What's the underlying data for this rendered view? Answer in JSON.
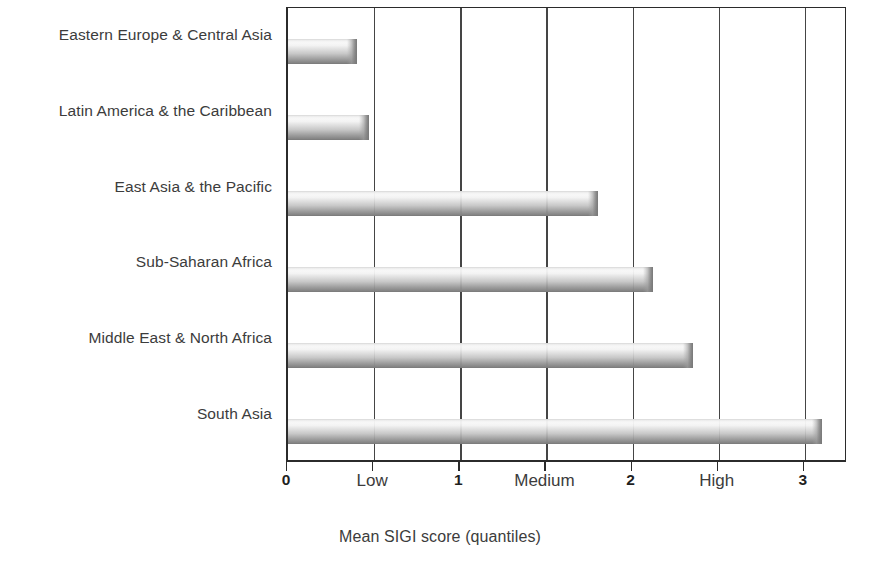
{
  "chart_data": {
    "type": "bar",
    "orientation": "horizontal",
    "title": "",
    "xlabel": "Mean SIGI score (quantiles)",
    "ylabel": "",
    "categories": [
      "Eastern Europe & Central Asia",
      "Latin America & the Caribbean",
      "East Asia & the Pacific",
      "Sub-Saharan Africa",
      "Middle East & North Africa",
      "South Asia"
    ],
    "values": [
      0.4,
      0.47,
      1.8,
      2.12,
      2.35,
      3.1
    ],
    "xlim": [
      0,
      3.25
    ],
    "ylim": [
      0,
      6
    ],
    "grid": true,
    "gridlines_x": [
      0.5,
      1,
      1.5,
      2,
      2.5,
      3
    ],
    "legend": "none",
    "bar_color": "#9e9e9e",
    "axis_color": "#2b2b2b",
    "tick_labels": [
      {
        "value": 0,
        "text": "0",
        "style": "numeric"
      },
      {
        "value": 0.5,
        "text": "Low",
        "style": "band"
      },
      {
        "value": 1,
        "text": "1",
        "style": "numeric"
      },
      {
        "value": 1.5,
        "text": "Medium",
        "style": "band"
      },
      {
        "value": 2,
        "text": "2",
        "style": "numeric"
      },
      {
        "value": 2.5,
        "text": "High",
        "style": "band"
      },
      {
        "value": 3,
        "text": "3",
        "style": "numeric"
      }
    ],
    "tick_positions": [
      0,
      0.5,
      1,
      1.5,
      2,
      2.5,
      3
    ]
  }
}
